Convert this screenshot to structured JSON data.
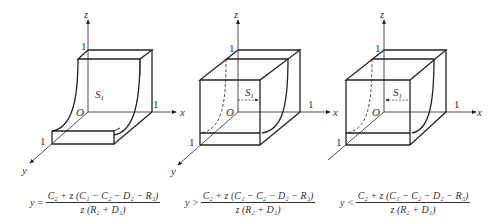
{
  "diagrams": [
    {
      "id": "equal",
      "axes": {
        "x": "x",
        "y": "y",
        "z": "z",
        "origin": "O",
        "tick": "1"
      },
      "surface_label": "S",
      "surface_sub": "1",
      "arrow": "none",
      "condition": {
        "lhs": "y =",
        "numerator": "C₂ + z (C₁ − C₂ − D₂ − R₃)",
        "denominator": "z (R₂ + D₁)"
      }
    },
    {
      "id": "greater",
      "axes": {
        "x": "x",
        "y": "y",
        "z": "z",
        "origin": "O",
        "tick": "1"
      },
      "surface_label": "S",
      "surface_sub": "1",
      "arrow": "right",
      "condition": {
        "lhs": "y >",
        "numerator": "C₂ + z (C₁ − C₂ − D₂ − R₃)",
        "denominator": "z (R₂ + D₁)"
      }
    },
    {
      "id": "less",
      "axes": {
        "x": "x",
        "y": "y",
        "z": "z",
        "origin": "O",
        "tick": "1"
      },
      "surface_label": "S",
      "surface_sub": "1",
      "arrow": "left",
      "condition": {
        "lhs": "y <",
        "numerator": "C₂ + z (C₁ − C₂ − D₂ − R₃)",
        "denominator": "z (R₂ + D₁)"
      }
    }
  ],
  "colors": {
    "line": "#222222",
    "text": "#333333",
    "background": "#ffffff"
  }
}
